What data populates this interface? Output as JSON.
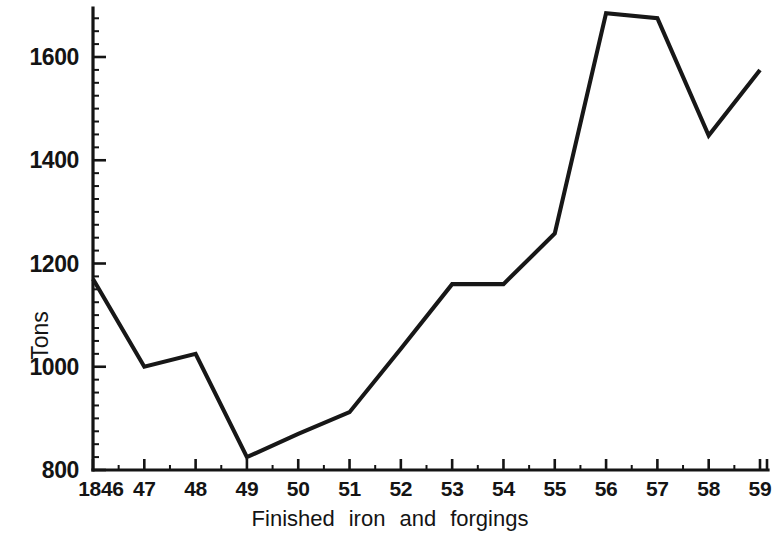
{
  "chart_data": {
    "type": "line",
    "title": "",
    "subtitle": "",
    "xlabel": "Finished  iron  and  forgings",
    "ylabel": "Tons",
    "xlabel_words": [
      "Finished",
      "iron",
      "and",
      "forgings"
    ],
    "x": [
      1846,
      1847,
      1848,
      1849,
      1850,
      1851,
      1852,
      1853,
      1854,
      1855,
      1856,
      1857,
      1858,
      1859
    ],
    "categories": [
      "1846",
      "47",
      "48",
      "49",
      "50",
      "51",
      "52",
      "53",
      "54",
      "55",
      "56",
      "57",
      "58",
      "59"
    ],
    "values": [
      1170,
      1000,
      1025,
      825,
      870,
      912,
      1035,
      1160,
      1160,
      1258,
      1685,
      1675,
      1448,
      1575
    ],
    "series": [
      {
        "name": "Finished iron and forgings",
        "values": [
          1170,
          1000,
          1025,
          825,
          870,
          912,
          1035,
          1160,
          1160,
          1258,
          1685,
          1675,
          1448,
          1575
        ]
      }
    ],
    "ylim": [
      800,
      1700
    ],
    "xlim": [
      1846,
      1859
    ],
    "ytick_labels": [
      "800",
      "1000",
      "1200",
      "1400",
      "1600"
    ],
    "ytick_values": [
      800,
      1000,
      1200,
      1400,
      1600
    ],
    "y_minor_step": 25,
    "grid": false,
    "legend": false,
    "legend_position": "none",
    "line_color": "#171717",
    "axis_color": "#141414",
    "background_color": "#ffffff"
  }
}
